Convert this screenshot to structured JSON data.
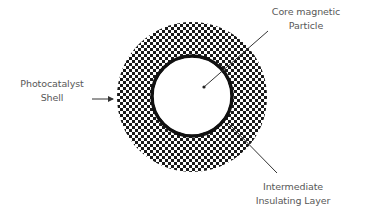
{
  "diagram": {
    "title": "",
    "type": "core-shell particle cross-section",
    "colors": {
      "background": "#ffffff",
      "dots": "#1a1a1a",
      "ring": "#111111",
      "lines": "#333333",
      "text": "#585858"
    },
    "layers": [
      {
        "id": "core",
        "name": "Core magnetic Particle",
        "fill": "white"
      },
      {
        "id": "insulating",
        "name": "Intermediate Insulating Layer",
        "fill": "solid black ring"
      },
      {
        "id": "shell",
        "name": "Photocatalyst Shell",
        "fill": "dot pattern"
      }
    ],
    "labels": {
      "core": {
        "line1": "Core magnetic",
        "line2": "Particle"
      },
      "shell": {
        "line1": "Photocatalyst",
        "line2": "Shell"
      },
      "insulating": {
        "line1": "Intermediate",
        "line2": "Insulating Layer"
      }
    }
  }
}
